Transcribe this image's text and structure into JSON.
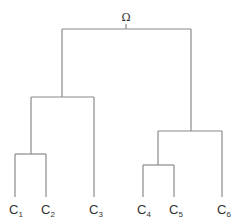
{
  "diagram": {
    "type": "dendrogram",
    "root": {
      "label": "Ω"
    },
    "leaves": [
      {
        "base": "C",
        "sub": "1"
      },
      {
        "base": "C",
        "sub": "2"
      },
      {
        "base": "C",
        "sub": "3"
      },
      {
        "base": "C",
        "sub": "4"
      },
      {
        "base": "C",
        "sub": "5"
      },
      {
        "base": "C",
        "sub": "6"
      }
    ],
    "structure": "((C1,C2),C3),((C4,C5),C6)",
    "line_color": "#8a8a8a"
  }
}
